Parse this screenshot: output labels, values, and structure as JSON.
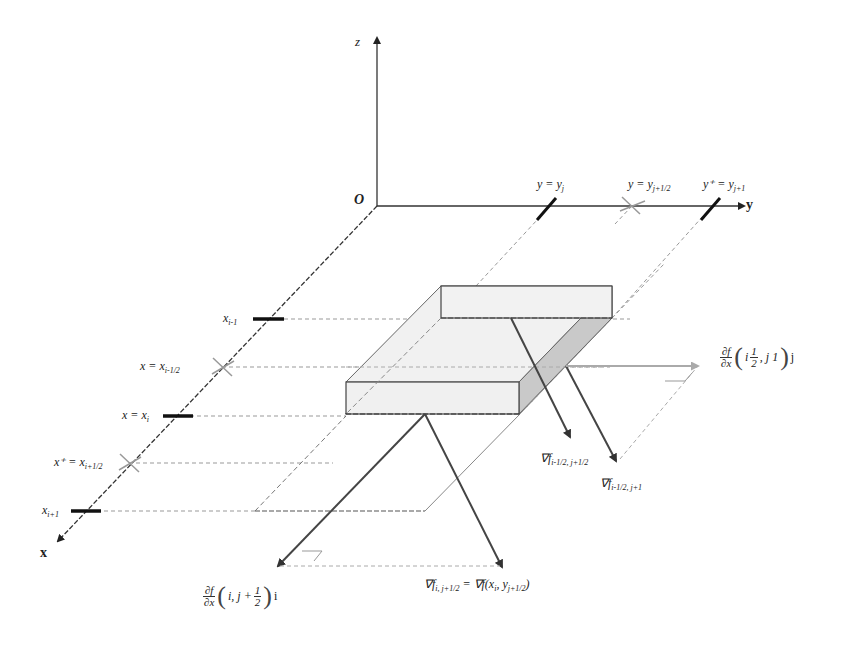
{
  "figure": {
    "type": "3d-coordinate-diagram",
    "colors": {
      "axis": "#333333",
      "dashed": "#888888",
      "face_fill": "#efefef",
      "side_fill": "#c8c8c8",
      "arrow": "#444444",
      "light_arrow": "#aaaaaa",
      "tick": "#111111",
      "cross": "#999999"
    }
  },
  "axes": {
    "origin_label": "O",
    "x_label": "x",
    "y_label": "y",
    "z_label": "z"
  },
  "x_ticks": [
    {
      "label": "x",
      "sub": "i-1",
      "kind": "tick"
    },
    {
      "label": "x = x",
      "sub": "i-1/2",
      "kind": "cross"
    },
    {
      "label": "x = x",
      "sub": "i",
      "kind": "tick"
    },
    {
      "label": "x⁺ = x",
      "sub": "i+1/2",
      "kind": "cross"
    },
    {
      "label": "x",
      "sub": "i+1",
      "kind": "tick"
    }
  ],
  "y_ticks": [
    {
      "label": "y = y",
      "sub": "j",
      "kind": "tick"
    },
    {
      "label": "y = y",
      "sub": "j+1/2",
      "kind": "cross"
    },
    {
      "label": "y⁺ = y",
      "sub": "j+1",
      "kind": "tick"
    }
  ],
  "vectors": {
    "grad_top_left": {
      "label": "∇f",
      "sub": "i-1/2, j+1/2"
    },
    "grad_top_right": {
      "label": "∇f",
      "sub": "i-1/2, j+1"
    },
    "grad_bottom": {
      "label": "∇f",
      "sub": "i, j+1/2",
      "rhs": " = ∇f(x",
      "rhs_sub1": "i",
      "rhs_mid": ", y",
      "rhs_sub2": "j+1/2",
      "rhs_end": ")"
    },
    "partial_x": {
      "num": "∂f",
      "den": "∂x",
      "args": "i, j + ",
      "half_num": "1",
      "half_den": "2",
      "unit": "i"
    },
    "partial_y": {
      "num": "∂f",
      "den": "∂x",
      "args_pre": "i  ",
      "half_num": "1",
      "half_den": "2",
      "args_post": ", j  1",
      "unit": "j"
    }
  }
}
